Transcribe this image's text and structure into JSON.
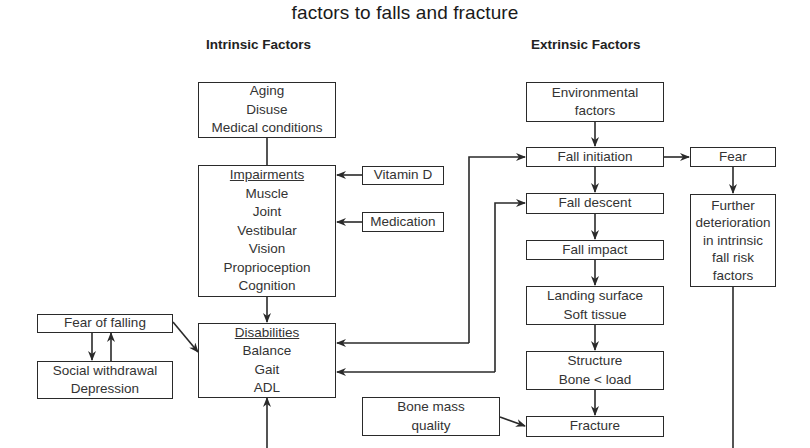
{
  "title": "factors to falls and fracture",
  "headings": {
    "intrinsic": "Intrinsic Factors",
    "extrinsic": "Extrinsic Factors"
  },
  "intrinsic": {
    "causes": [
      "Aging",
      "Disuse",
      "Medical conditions"
    ],
    "impairments": {
      "header": "Impairments",
      "items": [
        "Muscle",
        "Joint",
        "Vestibular",
        "Vision",
        "Proprioception",
        "Cognition"
      ]
    },
    "vitamin_d": "Vitamin D",
    "medication": "Medication",
    "disabilities": {
      "header": "Disabilities",
      "items": [
        "Balance",
        "Gait",
        "ADL"
      ]
    },
    "fear_of_falling": "Fear of falling",
    "social": [
      "Social withdrawal",
      "Depression"
    ]
  },
  "extrinsic": {
    "environmental": [
      "Environmental",
      "factors"
    ],
    "fall_initiation": "Fall initiation",
    "fall_descent": "Fall descent",
    "fall_impact": "Fall impact",
    "landing": [
      "Landing surface",
      "Soft tissue"
    ],
    "structure": [
      "Structure",
      "Bone < load"
    ],
    "fracture": "Fracture",
    "bone_mass": [
      "Bone mass",
      "quality"
    ],
    "fear": "Fear",
    "further": [
      "Further",
      "deterioration",
      "in intrinsic",
      "fall risk",
      "factors"
    ]
  },
  "colors": {
    "line": "#2a2a2a",
    "text": "#333333",
    "background": "#ffffff"
  }
}
